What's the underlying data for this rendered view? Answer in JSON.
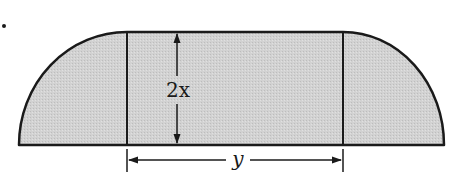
{
  "figure": {
    "fill_color": "#cfcfcf",
    "stroke_color": "#1a1a1a",
    "labels": {
      "height": "2x",
      "width": "y"
    },
    "dimensions": {
      "rectangle_height_label": "2x",
      "rectangle_width_label": "y"
    }
  }
}
